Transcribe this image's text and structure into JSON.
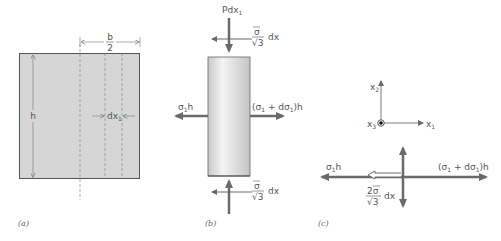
{
  "figure": {
    "colors": {
      "fill_gray": "#d6d6d6",
      "line_dark": "#555555",
      "arrow": "#6a6a6a",
      "dashed": "#8a8a8a"
    },
    "panel_a": {
      "caption": "(a)",
      "width_label_num": "b",
      "width_label_den": "2",
      "height_label": "h",
      "strip_label": "dx",
      "strip_label_sub": "1"
    },
    "panel_b": {
      "caption": "(b)",
      "top_load": "Pdx",
      "top_load_sub": "1",
      "shear_num": "σ",
      "shear_den": "√3",
      "shear_suffix": "dx",
      "left_force": "σ",
      "left_force_sub": "1",
      "left_force_suffix": "h",
      "right_force_open": "(σ",
      "right_force_sub1": "1",
      "right_force_mid": " + dσ",
      "right_force_sub2": "1",
      "right_force_close": ")h"
    },
    "panel_c": {
      "caption": "(c)",
      "axis_x2": "x",
      "axis_x2_sub": "2",
      "axis_x3": "x",
      "axis_x3_sub": "3",
      "axis_x1": "x",
      "axis_x1_sub": "1",
      "left_force": "σ",
      "left_force_sub": "1",
      "left_force_suffix": "h",
      "right_force_open": "(σ",
      "right_force_sub1": "1",
      "right_force_mid": " + dσ",
      "right_force_sub2": "1",
      "right_force_close": ")h",
      "shear_num": "2σ",
      "shear_den": "√3",
      "shear_suffix": "dx"
    }
  }
}
